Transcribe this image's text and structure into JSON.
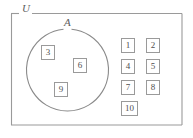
{
  "diagram": {
    "type": "venn-set-diagram",
    "colors": {
      "background": "#ffffff",
      "stroke": "#9a9a9a",
      "circle_stroke": "#8a8a8a",
      "text": "#4f4f4f",
      "label_text": "#5d5d5d"
    },
    "universe": {
      "label": "U",
      "shape": "rectangle",
      "x": 11,
      "y": 13,
      "width": 171,
      "height": 112
    },
    "set_a": {
      "label": "A",
      "shape": "circle",
      "cx": 67,
      "cy": 70,
      "r": 41
    },
    "elements_in_a": [
      {
        "label": "3",
        "x": 41,
        "y": 45
      },
      {
        "label": "6",
        "x": 73,
        "y": 58
      },
      {
        "label": "9",
        "x": 54,
        "y": 82
      }
    ],
    "elements_outside_a": [
      {
        "label": "1",
        "x": 121,
        "y": 38
      },
      {
        "label": "2",
        "x": 146,
        "y": 38
      },
      {
        "label": "4",
        "x": 121,
        "y": 59
      },
      {
        "label": "5",
        "x": 146,
        "y": 59
      },
      {
        "label": "7",
        "x": 121,
        "y": 80
      },
      {
        "label": "8",
        "x": 146,
        "y": 80
      },
      {
        "label": "10",
        "x": 121,
        "y": 101,
        "wide": true
      }
    ]
  }
}
